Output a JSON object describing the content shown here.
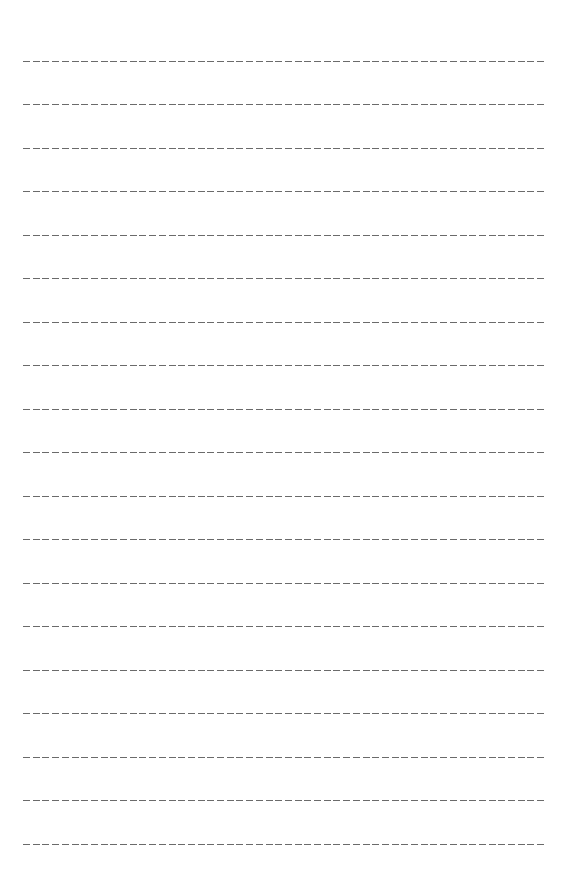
{
  "page": {
    "type": "ruled-writing-sheet",
    "background_color": "#ffffff",
    "line_color": "#5a5a5a",
    "line_style": "dashed",
    "line_count": 19,
    "line_left": 23,
    "line_right": 545,
    "first_line_y": 61,
    "line_spacing": 43.5
  },
  "lines": [
    {
      "y": 61
    },
    {
      "y": 104
    },
    {
      "y": 148
    },
    {
      "y": 191
    },
    {
      "y": 235
    },
    {
      "y": 278
    },
    {
      "y": 322
    },
    {
      "y": 365
    },
    {
      "y": 409
    },
    {
      "y": 452
    },
    {
      "y": 496
    },
    {
      "y": 539
    },
    {
      "y": 583
    },
    {
      "y": 626
    },
    {
      "y": 670
    },
    {
      "y": 713
    },
    {
      "y": 757
    },
    {
      "y": 800
    },
    {
      "y": 844
    }
  ]
}
